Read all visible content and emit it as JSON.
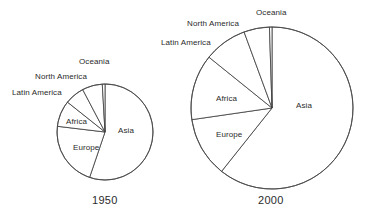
{
  "chart_data": [
    {
      "type": "pie",
      "title": "1950",
      "categories": [
        "Asia",
        "Europe",
        "Africa",
        "Latin America",
        "North America",
        "Oceania"
      ],
      "values": [
        55.2,
        21.7,
        8.8,
        6.6,
        6.8,
        0.9
      ],
      "unit": "percent of world population",
      "legend": "none",
      "labels_placement": "in-slice-and-leader",
      "center": [
        105,
        132
      ],
      "radius": 48,
      "start_angle_deg": -90,
      "direction": "clockwise"
    },
    {
      "type": "pie",
      "title": "2000",
      "categories": [
        "Asia",
        "Europe",
        "Africa",
        "Latin America",
        "North America",
        "Oceania"
      ],
      "values": [
        60.7,
        12.0,
        13.1,
        8.6,
        5.1,
        0.5
      ],
      "unit": "percent of world population",
      "legend": "none",
      "labels_placement": "in-slice-and-leader",
      "center": [
        272,
        108
      ],
      "radius": 81,
      "start_angle_deg": -90,
      "direction": "clockwise"
    }
  ],
  "charts": [
    {
      "id": "pie-1950",
      "caption": "1950",
      "caption_pos": [
        92,
        194
      ],
      "outside_labels": [
        {
          "key": "oceania",
          "text": "Oceania",
          "x": 79,
          "y": 57
        },
        {
          "key": "north-america",
          "text": "North America",
          "x": 35,
          "y": 72
        },
        {
          "key": "latin-america",
          "text": "Latin America",
          "x": 12,
          "y": 88
        }
      ],
      "inside_labels": [
        {
          "key": "asia",
          "text": "Asia",
          "x": 118,
          "y": 126
        },
        {
          "key": "europe",
          "text": "Europe",
          "x": 73,
          "y": 143
        },
        {
          "key": "africa",
          "text": "Africa",
          "x": 66,
          "y": 117
        }
      ]
    },
    {
      "id": "pie-2000",
      "caption": "2000",
      "caption_pos": [
        258,
        194
      ],
      "outside_labels": [
        {
          "key": "oceania",
          "text": "Oceania",
          "x": 256,
          "y": 8
        },
        {
          "key": "north-america",
          "text": "North America",
          "x": 187,
          "y": 19
        },
        {
          "key": "latin-america",
          "text": "Latin America",
          "x": 161,
          "y": 38
        }
      ],
      "inside_labels": [
        {
          "key": "asia",
          "text": "Asia",
          "x": 296,
          "y": 101
        },
        {
          "key": "europe",
          "text": "Europe",
          "x": 216,
          "y": 130
        },
        {
          "key": "africa",
          "text": "Africa",
          "x": 216,
          "y": 94
        }
      ]
    }
  ],
  "style": {
    "stroke": "#3a3a3a",
    "fill": "#ffffff",
    "text": "#2b2b2b",
    "background": "#ffffff"
  }
}
